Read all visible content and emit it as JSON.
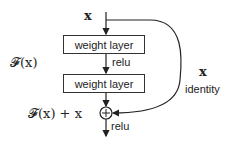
{
  "diagram": {
    "input_label": "x",
    "layer1_label": "weight layer",
    "activation1_label": "relu",
    "layer2_label": "weight layer",
    "residual_function_label": "𝓕(x)",
    "sum_label": "𝓕(x) + x",
    "sum_symbol": "+",
    "output_activation_label": "relu",
    "shortcut_var_label": "x",
    "shortcut_label": "identity"
  }
}
